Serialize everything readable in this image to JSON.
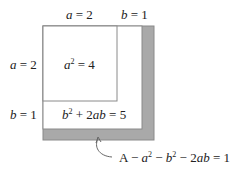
{
  "diagram": {
    "type": "area-model-square",
    "top_labels": [
      {
        "var": "a",
        "eq": " = ",
        "val": "2"
      },
      {
        "var": "b",
        "eq": " = ",
        "val": "1"
      }
    ],
    "left_labels": [
      {
        "var": "a",
        "eq": " = ",
        "val": "2"
      },
      {
        "var": "b",
        "eq": " = ",
        "val": "1"
      }
    ],
    "regions": {
      "a_squared": {
        "base": "a",
        "exp": "2",
        "rest": " = 4"
      },
      "l_shape": {
        "b": "b",
        "exp": "2",
        "rest": " + 2",
        "ab": "ab",
        "tail": " = 5"
      },
      "remainder": {
        "A": "A",
        "m1": " − ",
        "a": "a",
        "e1": "2",
        "m2": " − ",
        "b": "b",
        "e2": "2",
        "m3": " − 2",
        "ab": "ab",
        "tail": " = 1"
      }
    },
    "colors": {
      "stroke": "#8a8a8a",
      "shaded": "#a9a9a9",
      "background": "#ffffff"
    }
  }
}
